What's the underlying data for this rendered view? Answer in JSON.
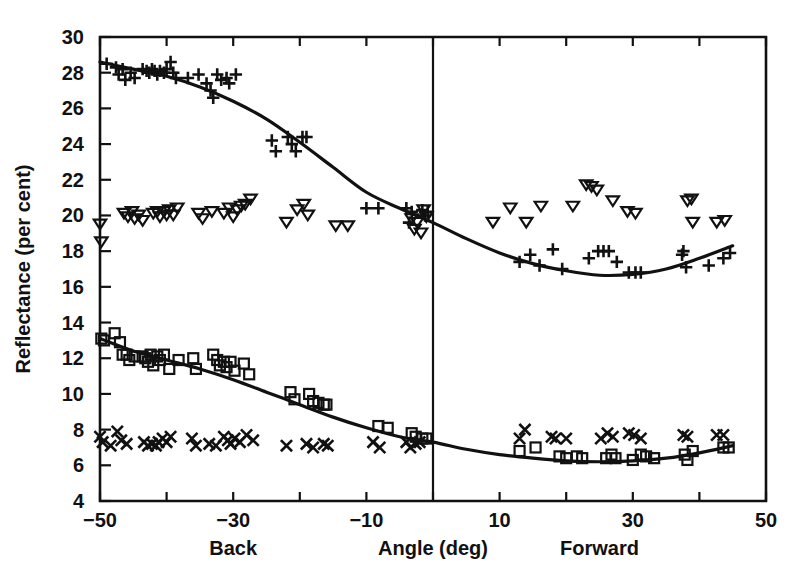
{
  "chart_data": {
    "type": "scatter",
    "title": "",
    "xlabel": "Angle (deg)",
    "ylabel": "Reflectance (per cent)",
    "xlim": [
      -50,
      50
    ],
    "ylim": [
      4,
      30
    ],
    "grid": false,
    "legend_position": "none",
    "x_ticks": [
      -50,
      -40,
      -30,
      -20,
      -10,
      0,
      10,
      20,
      30,
      40,
      50
    ],
    "x_tick_labels": [
      "-50",
      "",
      "-30",
      "",
      "-10",
      "",
      "10",
      "",
      "30",
      "",
      "50"
    ],
    "y_ticks": [
      4,
      6,
      8,
      10,
      12,
      14,
      16,
      18,
      20,
      22,
      24,
      26,
      28,
      30
    ],
    "y_tick_labels": [
      "4",
      "6",
      "8",
      "10",
      "12",
      "14",
      "16",
      "18",
      "20",
      "22",
      "24",
      "26",
      "28",
      "30"
    ],
    "annotations": [
      {
        "text": "Back",
        "x": -30,
        "below_axis": true
      },
      {
        "text": "Angle (deg)",
        "x": 0,
        "below_axis": true
      },
      {
        "text": "Forward",
        "x": 25,
        "below_axis": true
      }
    ],
    "reference_lines": [
      {
        "orientation": "vertical",
        "x": 0,
        "label": "zero-angle-divider"
      }
    ],
    "series": [
      {
        "name": "upper-plus",
        "marker": "plus",
        "points": [
          [
            -49.0,
            28.5
          ],
          [
            -47.6,
            28.3
          ],
          [
            -47.2,
            27.9
          ],
          [
            -46.6,
            28.2
          ],
          [
            -46.2,
            27.6
          ],
          [
            -45.4,
            28.0
          ],
          [
            -44.8,
            27.7
          ],
          [
            -43.6,
            28.2
          ],
          [
            -43.0,
            28.1
          ],
          [
            -42.6,
            28.0
          ],
          [
            -42.2,
            28.2
          ],
          [
            -41.8,
            28.1
          ],
          [
            -41.4,
            27.9
          ],
          [
            -41.0,
            28.1
          ],
          [
            -40.4,
            28.0
          ],
          [
            -40.0,
            28.2
          ],
          [
            -39.4,
            28.6
          ],
          [
            -39.0,
            28.0
          ],
          [
            -38.6,
            27.7
          ],
          [
            -36.8,
            27.7
          ],
          [
            -35.2,
            27.9
          ],
          [
            -34.0,
            27.4
          ],
          [
            -33.4,
            27.0
          ],
          [
            -33.0,
            26.6
          ],
          [
            -32.4,
            27.9
          ],
          [
            -31.8,
            27.6
          ],
          [
            -31.0,
            27.7
          ],
          [
            -30.6,
            27.4
          ],
          [
            -29.6,
            27.9
          ],
          [
            -24.2,
            24.2
          ],
          [
            -23.6,
            23.6
          ],
          [
            -21.8,
            24.4
          ],
          [
            -21.2,
            24.0
          ],
          [
            -20.6,
            23.6
          ],
          [
            -19.6,
            24.4
          ],
          [
            -19.0,
            24.4
          ],
          [
            -10.0,
            20.4
          ],
          [
            -8.2,
            20.4
          ],
          [
            -4.0,
            20.4
          ],
          [
            -3.6,
            19.6
          ],
          [
            -3.2,
            20.2
          ],
          [
            -1.6,
            20.3
          ],
          [
            -1.2,
            20.0
          ],
          [
            -0.8,
            20.2
          ],
          [
            13.0,
            17.4
          ],
          [
            14.6,
            17.8
          ],
          [
            16.0,
            17.2
          ],
          [
            18.0,
            18.1
          ],
          [
            19.4,
            17.0
          ],
          [
            23.4,
            17.6
          ],
          [
            24.8,
            18.0
          ],
          [
            25.6,
            18.0
          ],
          [
            26.4,
            18.0
          ],
          [
            27.6,
            17.4
          ],
          [
            29.4,
            16.8
          ],
          [
            30.4,
            16.8
          ],
          [
            31.2,
            16.8
          ],
          [
            37.4,
            17.8
          ],
          [
            37.6,
            18.0
          ],
          [
            38.0,
            17.1
          ],
          [
            41.4,
            17.2
          ],
          [
            43.6,
            17.6
          ],
          [
            44.6,
            17.9
          ]
        ]
      },
      {
        "name": "upper-triangle",
        "marker": "triangle-down",
        "points": [
          [
            -50.0,
            19.5
          ],
          [
            -49.8,
            18.5
          ],
          [
            -46.4,
            20.1
          ],
          [
            -45.8,
            19.9
          ],
          [
            -45.2,
            20.2
          ],
          [
            -44.8,
            19.8
          ],
          [
            -44.2,
            20.0
          ],
          [
            -43.6,
            19.7
          ],
          [
            -42.0,
            20.1
          ],
          [
            -41.4,
            20.2
          ],
          [
            -41.0,
            19.9
          ],
          [
            -40.4,
            20.2
          ],
          [
            -40.0,
            20.0
          ],
          [
            -39.6,
            20.3
          ],
          [
            -39.0,
            20.0
          ],
          [
            -38.4,
            20.4
          ],
          [
            -35.2,
            20.1
          ],
          [
            -34.6,
            19.8
          ],
          [
            -33.2,
            20.2
          ],
          [
            -31.4,
            20.1
          ],
          [
            -30.6,
            20.4
          ],
          [
            -30.0,
            19.9
          ],
          [
            -29.4,
            20.3
          ],
          [
            -28.8,
            20.5
          ],
          [
            -28.2,
            20.6
          ],
          [
            -27.4,
            20.9
          ],
          [
            -22.0,
            19.6
          ],
          [
            -20.4,
            20.3
          ],
          [
            -19.4,
            20.6
          ],
          [
            -18.8,
            20.0
          ],
          [
            -14.6,
            19.4
          ],
          [
            -12.8,
            19.4
          ],
          [
            -3.2,
            19.8
          ],
          [
            -2.8,
            19.2
          ],
          [
            -2.4,
            19.6
          ],
          [
            -1.8,
            19.0
          ],
          [
            -1.4,
            20.3
          ],
          [
            -1.0,
            19.9
          ],
          [
            9.0,
            19.6
          ],
          [
            11.6,
            20.4
          ],
          [
            14.0,
            19.6
          ],
          [
            16.2,
            20.5
          ],
          [
            21.0,
            20.5
          ],
          [
            23.0,
            21.7
          ],
          [
            23.8,
            21.6
          ],
          [
            24.6,
            21.4
          ],
          [
            27.0,
            20.8
          ],
          [
            29.2,
            20.2
          ],
          [
            30.4,
            20.1
          ],
          [
            38.2,
            20.8
          ],
          [
            38.8,
            20.9
          ],
          [
            39.0,
            19.6
          ],
          [
            42.6,
            19.6
          ],
          [
            43.8,
            19.7
          ]
        ]
      },
      {
        "name": "lower-square",
        "marker": "square",
        "points": [
          [
            -49.8,
            13.1
          ],
          [
            -49.4,
            13.0
          ],
          [
            -47.8,
            13.4
          ],
          [
            -47.0,
            12.9
          ],
          [
            -46.6,
            12.2
          ],
          [
            -46.0,
            12.2
          ],
          [
            -45.6,
            11.9
          ],
          [
            -44.8,
            12.1
          ],
          [
            -43.6,
            12.1
          ],
          [
            -43.2,
            12.0
          ],
          [
            -42.8,
            11.8
          ],
          [
            -42.4,
            12.2
          ],
          [
            -42.0,
            11.6
          ],
          [
            -41.4,
            12.1
          ],
          [
            -41.0,
            11.9
          ],
          [
            -40.4,
            12.2
          ],
          [
            -39.6,
            11.4
          ],
          [
            -38.2,
            11.9
          ],
          [
            -36.0,
            12.0
          ],
          [
            -35.6,
            11.4
          ],
          [
            -33.0,
            12.2
          ],
          [
            -32.4,
            11.9
          ],
          [
            -32.0,
            11.6
          ],
          [
            -31.4,
            11.8
          ],
          [
            -31.0,
            11.5
          ],
          [
            -30.4,
            11.8
          ],
          [
            -29.8,
            11.3
          ],
          [
            -28.4,
            11.7
          ],
          [
            -27.6,
            11.1
          ],
          [
            -21.4,
            10.1
          ],
          [
            -20.8,
            9.7
          ],
          [
            -18.6,
            10.0
          ],
          [
            -18.0,
            9.6
          ],
          [
            -17.2,
            9.5
          ],
          [
            -16.4,
            9.4
          ],
          [
            -16.0,
            9.4
          ],
          [
            -8.2,
            8.2
          ],
          [
            -6.8,
            8.1
          ],
          [
            -3.2,
            7.8
          ],
          [
            -2.6,
            7.6
          ],
          [
            -1.6,
            7.5
          ],
          [
            -1.0,
            7.5
          ],
          [
            13.0,
            6.8
          ],
          [
            15.4,
            7.0
          ],
          [
            19.0,
            6.5
          ],
          [
            20.0,
            6.4
          ],
          [
            21.6,
            6.5
          ],
          [
            22.4,
            6.4
          ],
          [
            26.0,
            6.4
          ],
          [
            26.8,
            6.6
          ],
          [
            27.4,
            6.4
          ],
          [
            30.0,
            6.3
          ],
          [
            31.2,
            6.6
          ],
          [
            32.0,
            6.5
          ],
          [
            33.2,
            6.4
          ],
          [
            37.8,
            6.6
          ],
          [
            38.2,
            6.3
          ],
          [
            39.0,
            6.8
          ],
          [
            43.6,
            7.0
          ],
          [
            44.4,
            7.0
          ]
        ]
      },
      {
        "name": "lower-cross",
        "marker": "x",
        "points": [
          [
            -50.0,
            7.6
          ],
          [
            -49.6,
            7.3
          ],
          [
            -48.4,
            7.1
          ],
          [
            -47.4,
            7.9
          ],
          [
            -46.8,
            7.4
          ],
          [
            -46.0,
            7.2
          ],
          [
            -43.4,
            7.3
          ],
          [
            -42.8,
            7.1
          ],
          [
            -42.2,
            7.2
          ],
          [
            -41.6,
            7.1
          ],
          [
            -41.2,
            7.3
          ],
          [
            -40.6,
            7.5
          ],
          [
            -40.0,
            7.3
          ],
          [
            -39.4,
            7.6
          ],
          [
            -36.2,
            7.5
          ],
          [
            -35.6,
            7.1
          ],
          [
            -33.6,
            7.2
          ],
          [
            -32.6,
            7.1
          ],
          [
            -31.4,
            7.6
          ],
          [
            -30.8,
            7.4
          ],
          [
            -30.4,
            7.2
          ],
          [
            -29.8,
            7.5
          ],
          [
            -29.0,
            7.3
          ],
          [
            -28.0,
            7.7
          ],
          [
            -27.0,
            7.4
          ],
          [
            -22.0,
            7.1
          ],
          [
            -19.0,
            7.2
          ],
          [
            -18.0,
            7.0
          ],
          [
            -16.4,
            7.2
          ],
          [
            -15.8,
            7.1
          ],
          [
            -9.0,
            7.3
          ],
          [
            -8.0,
            7.0
          ],
          [
            -4.0,
            7.3
          ],
          [
            -3.4,
            7.0
          ],
          [
            -2.6,
            7.2
          ],
          [
            -2.0,
            7.3
          ],
          [
            13.0,
            7.5
          ],
          [
            13.8,
            8.0
          ],
          [
            17.8,
            7.6
          ],
          [
            18.4,
            7.5
          ],
          [
            20.0,
            7.5
          ],
          [
            25.2,
            7.5
          ],
          [
            26.2,
            7.8
          ],
          [
            27.0,
            7.6
          ],
          [
            29.4,
            7.8
          ],
          [
            30.2,
            7.7
          ],
          [
            31.2,
            7.5
          ],
          [
            37.6,
            7.7
          ],
          [
            38.2,
            7.6
          ],
          [
            42.6,
            7.7
          ],
          [
            43.6,
            7.7
          ]
        ]
      }
    ],
    "fit_curves": [
      {
        "name": "upper-fit-curve",
        "points": [
          [
            -50.0,
            28.6
          ],
          [
            -45.0,
            28.2
          ],
          [
            -40.0,
            27.8
          ],
          [
            -35.0,
            27.2
          ],
          [
            -30.0,
            26.4
          ],
          [
            -25.0,
            25.4
          ],
          [
            -20.0,
            24.1
          ],
          [
            -15.0,
            22.7
          ],
          [
            -10.0,
            21.3
          ],
          [
            -5.0,
            20.4
          ],
          [
            0.0,
            19.6
          ],
          [
            5.0,
            18.7
          ],
          [
            10.0,
            17.9
          ],
          [
            15.0,
            17.3
          ],
          [
            20.0,
            16.9
          ],
          [
            25.0,
            16.65
          ],
          [
            30.0,
            16.7
          ],
          [
            35.0,
            17.0
          ],
          [
            40.0,
            17.6
          ],
          [
            45.0,
            18.3
          ]
        ]
      },
      {
        "name": "lower-fit-curve",
        "points": [
          [
            -50.0,
            13.1
          ],
          [
            -45.0,
            12.4
          ],
          [
            -40.0,
            11.9
          ],
          [
            -35.0,
            11.4
          ],
          [
            -30.0,
            10.8
          ],
          [
            -25.0,
            10.1
          ],
          [
            -20.0,
            9.4
          ],
          [
            -15.0,
            8.7
          ],
          [
            -10.0,
            8.1
          ],
          [
            -5.0,
            7.6
          ],
          [
            0.0,
            7.3
          ],
          [
            5.0,
            6.9
          ],
          [
            10.0,
            6.6
          ],
          [
            15.0,
            6.4
          ],
          [
            20.0,
            6.25
          ],
          [
            25.0,
            6.2
          ],
          [
            30.0,
            6.25
          ],
          [
            35.0,
            6.4
          ],
          [
            40.0,
            6.7
          ],
          [
            45.0,
            7.1
          ]
        ]
      }
    ]
  }
}
